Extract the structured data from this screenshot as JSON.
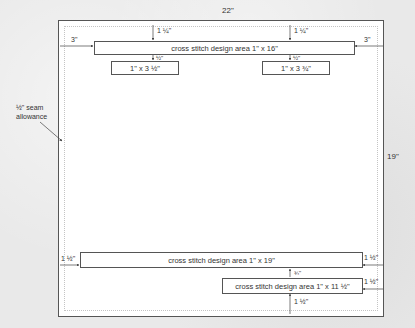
{
  "diagram": {
    "overall_width_label": "22\"",
    "overall_height_label": "19\"",
    "seam_allowance_label_line1": "½\" seam",
    "seam_allowance_label_line2": "allowance",
    "top_band": {
      "box_label": "cross stitch design area 1\" x 16\"",
      "left_offset_label": "3\"",
      "right_offset_label": "3\"",
      "top_offset_left_label": "1 ¼\"",
      "top_offset_right_label": "1 ¼\"",
      "gap_left_label": "½\"",
      "gap_right_label": "½\"",
      "small_left_box_label": "1\" x 3 ½\"",
      "small_right_box_label": "1\" x 3 ¾\""
    },
    "bottom_band": {
      "box_label": "cross stitch design area 1\" x 19\"",
      "left_offset_label": "1 ½\"",
      "right_offset_label": "1 ½\"",
      "gap_label": "¾\"",
      "small_box_label": "cross stitch design area 1\" x 11 ½\"",
      "small_box_right_offset_label": "1 ½\"",
      "bottom_offset_label": "1 ½\""
    },
    "colors": {
      "line": "#555555",
      "seam_line": "#c4c4c4",
      "fabric": "#ffffff",
      "background": "#e9e9e9"
    }
  }
}
